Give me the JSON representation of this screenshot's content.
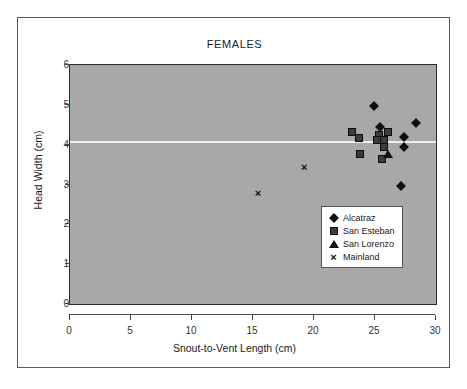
{
  "chart_data": {
    "type": "scatter",
    "title": "FEMALES",
    "xlabel": "Snout-to-Vent Length (cm)",
    "ylabel": "Head Width (cm)",
    "xlim": [
      0,
      30
    ],
    "ylim": [
      0,
      6
    ],
    "xticks": [
      0,
      5,
      10,
      15,
      20,
      25,
      30
    ],
    "yticks": [
      0,
      1,
      2,
      3,
      4,
      5,
      6
    ],
    "grid": false,
    "legend_position": "lower-right",
    "reference_line": {
      "orientation": "horizontal",
      "y": 4.07,
      "color": "#efefef"
    },
    "plot_background": "#a8a8a8",
    "series": [
      {
        "name": "Alcatraz",
        "marker": "diamond",
        "color": "#111111",
        "points": [
          {
            "x": 24.9,
            "y": 4.96
          },
          {
            "x": 25.4,
            "y": 4.45
          },
          {
            "x": 28.4,
            "y": 4.55
          },
          {
            "x": 27.4,
            "y": 4.19
          },
          {
            "x": 27.4,
            "y": 3.94
          },
          {
            "x": 27.1,
            "y": 2.95
          }
        ]
      },
      {
        "name": "San Esteban",
        "marker": "square",
        "color": "#3c3c3c",
        "points": [
          {
            "x": 23.1,
            "y": 4.32
          },
          {
            "x": 23.7,
            "y": 4.16
          },
          {
            "x": 23.8,
            "y": 3.77
          },
          {
            "x": 25.3,
            "y": 4.24
          },
          {
            "x": 25.2,
            "y": 4.11
          },
          {
            "x": 25.7,
            "y": 4.12
          },
          {
            "x": 26.1,
            "y": 4.31
          },
          {
            "x": 25.7,
            "y": 3.93
          },
          {
            "x": 25.6,
            "y": 3.64
          }
        ]
      },
      {
        "name": "San Lorenzo",
        "marker": "triangle",
        "color": "#0d0d0d",
        "points": [
          {
            "x": 26.1,
            "y": 3.76
          }
        ]
      },
      {
        "name": "Mainland",
        "marker": "cross",
        "color": "#0d0d0d",
        "points": [
          {
            "x": 15.4,
            "y": 2.78
          },
          {
            "x": 19.2,
            "y": 3.45
          }
        ]
      }
    ]
  }
}
